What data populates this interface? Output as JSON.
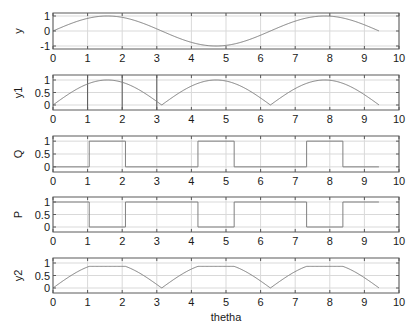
{
  "figure": {
    "width": 417,
    "height": 327,
    "background": "#ffffff",
    "line_color": "#808080",
    "grid_color": "#d9d9d9",
    "axes_color": "#5a5a5a",
    "text_color": "#1a1a1a"
  },
  "chart_data": [
    {
      "type": "line",
      "title": "",
      "xlabel": "",
      "ylabel": "y",
      "xlim": [
        0,
        10
      ],
      "ylim": [
        -1.2,
        1.2
      ],
      "xticks": [
        "0",
        "1",
        "2",
        "3",
        "4",
        "5",
        "6",
        "7",
        "8",
        "9",
        "10"
      ],
      "yticks": [
        "-1",
        "0",
        "1"
      ],
      "ytick_values": [
        -1,
        0,
        1
      ],
      "grid": true,
      "function": "sin",
      "x_range": [
        0,
        9.42
      ],
      "x": [
        0,
        0.5,
        1,
        1.5708,
        2,
        2.5,
        3,
        3.1416,
        3.5,
        4,
        4.5,
        4.7124,
        5,
        5.5,
        6,
        6.2832,
        6.5,
        7,
        7.5,
        7.854,
        8,
        8.5,
        9,
        9.42
      ],
      "values": [
        0,
        0.48,
        0.84,
        1,
        0.91,
        0.6,
        0.14,
        0,
        -0.35,
        -0.76,
        -0.98,
        -1,
        -0.96,
        -0.71,
        -0.28,
        0,
        0.22,
        0.66,
        0.94,
        1,
        0.99,
        0.8,
        0.41,
        0
      ]
    },
    {
      "type": "line",
      "title": "",
      "xlabel": "",
      "ylabel": "y1",
      "xlim": [
        0,
        10
      ],
      "ylim": [
        -0.2,
        1.2
      ],
      "xticks": [
        "0",
        "1",
        "2",
        "3",
        "4",
        "5",
        "6",
        "7",
        "8",
        "9",
        "10"
      ],
      "yticks": [
        "0",
        "0.5",
        "1"
      ],
      "ytick_values": [
        0,
        0.5,
        1
      ],
      "grid": true,
      "dark_vlines": [
        1,
        2,
        3
      ],
      "function": "abs_sin",
      "x_range": [
        0,
        9.42
      ],
      "x": [
        0,
        0.5,
        1,
        1.5708,
        2,
        2.5,
        3,
        3.1416,
        3.5,
        4,
        4.5,
        4.7124,
        5,
        5.5,
        6,
        6.2832,
        6.5,
        7,
        7.5,
        7.854,
        8,
        8.5,
        9,
        9.42
      ],
      "values": [
        0,
        0.48,
        0.84,
        1,
        0.91,
        0.6,
        0.14,
        0,
        0.35,
        0.76,
        0.98,
        1,
        0.96,
        0.71,
        0.28,
        0,
        0.22,
        0.66,
        0.94,
        1,
        0.99,
        0.8,
        0.41,
        0
      ]
    },
    {
      "type": "line",
      "title": "",
      "xlabel": "",
      "ylabel": "Q",
      "xlim": [
        0,
        10
      ],
      "ylim": [
        -0.2,
        1.2
      ],
      "xticks": [
        "0",
        "1",
        "2",
        "3",
        "4",
        "5",
        "6",
        "7",
        "8",
        "9",
        "10"
      ],
      "yticks": [
        "0",
        "0.5",
        "1"
      ],
      "ytick_values": [
        0,
        0.5,
        1
      ],
      "grid": true,
      "function": "step",
      "x_range": [
        0,
        9.42
      ],
      "x": [
        0,
        1.047,
        1.047,
        2.094,
        2.094,
        4.189,
        4.189,
        5.236,
        5.236,
        7.33,
        7.33,
        8.378,
        8.378,
        9.42
      ],
      "values": [
        0,
        0,
        1,
        1,
        0,
        0,
        1,
        1,
        0,
        0,
        1,
        1,
        0,
        0
      ]
    },
    {
      "type": "line",
      "title": "",
      "xlabel": "",
      "ylabel": "P",
      "xlim": [
        0,
        10
      ],
      "ylim": [
        -0.2,
        1.2
      ],
      "xticks": [
        "0",
        "1",
        "2",
        "3",
        "4",
        "5",
        "6",
        "7",
        "8",
        "9",
        "10"
      ],
      "yticks": [
        "0",
        "0.5",
        "1"
      ],
      "ytick_values": [
        0,
        0.5,
        1
      ],
      "grid": true,
      "function": "step",
      "x_range": [
        0,
        9.42
      ],
      "x": [
        0,
        1.047,
        1.047,
        2.094,
        2.094,
        4.189,
        4.189,
        5.236,
        5.236,
        7.33,
        7.33,
        8.378,
        8.378,
        9.42
      ],
      "values": [
        1,
        1,
        0,
        0,
        1,
        1,
        0,
        0,
        1,
        1,
        0,
        0,
        1,
        1
      ]
    },
    {
      "type": "line",
      "title": "",
      "xlabel": "thetha",
      "ylabel": "y2",
      "xlim": [
        0,
        10
      ],
      "ylim": [
        -0.2,
        1.2
      ],
      "xticks": [
        "0",
        "1",
        "2",
        "3",
        "4",
        "5",
        "6",
        "7",
        "8",
        "9",
        "10"
      ],
      "yticks": [
        "0",
        "0.5",
        "1"
      ],
      "ytick_values": [
        0,
        0.5,
        1
      ],
      "grid": true,
      "function": "clipped_abs_sin",
      "x_range": [
        0,
        9.42
      ],
      "x": [
        0,
        0.5,
        1.047,
        2.094,
        2.5,
        3,
        3.1416,
        3.5,
        4.189,
        5.236,
        5.5,
        6,
        6.2832,
        6.5,
        7.33,
        8.378,
        8.5,
        9,
        9.42
      ],
      "values": [
        0,
        0.48,
        0.866,
        0.866,
        0.6,
        0.14,
        0,
        0.35,
        0.866,
        0.866,
        0.71,
        0.28,
        0,
        0.22,
        0.866,
        0.866,
        0.8,
        0.41,
        0
      ]
    }
  ]
}
